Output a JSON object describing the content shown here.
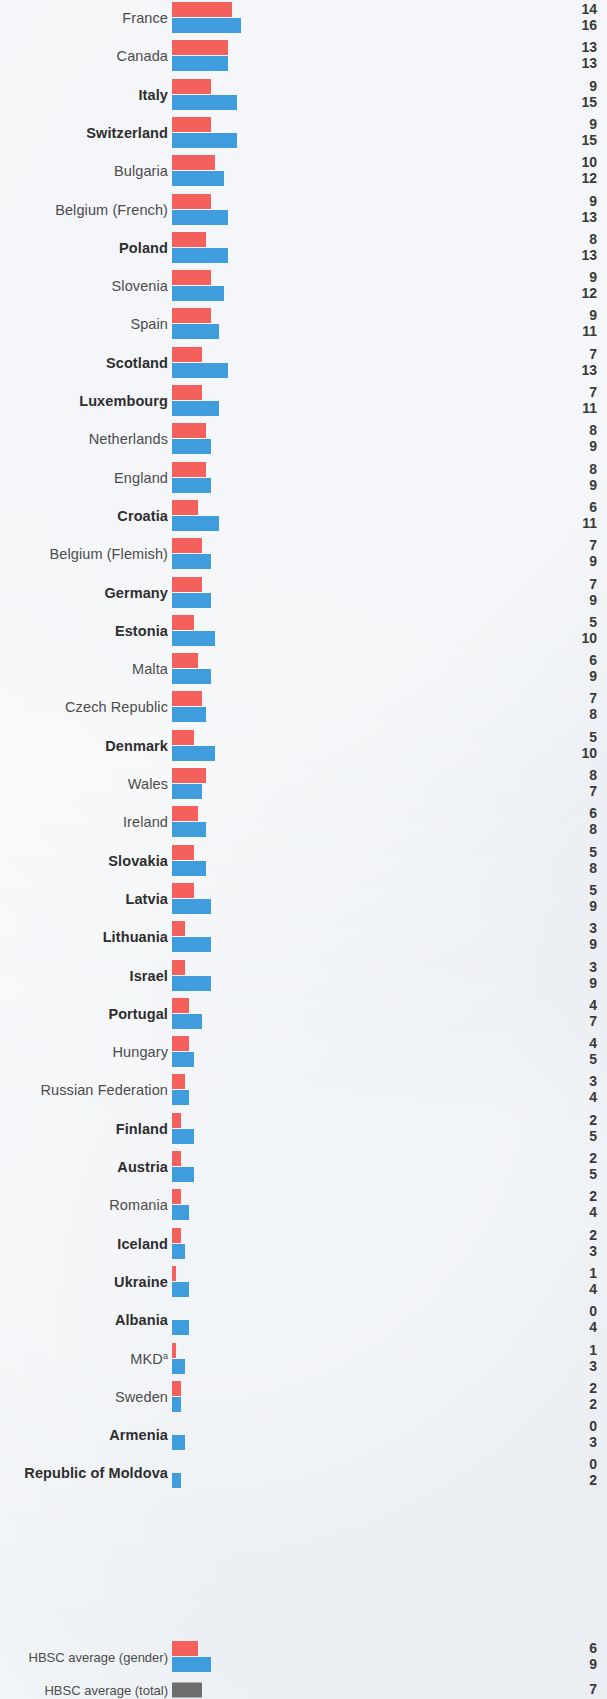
{
  "chart_data": {
    "type": "bar",
    "orientation": "horizontal",
    "title": "",
    "subtitle": "",
    "xlabel": "",
    "ylabel": "",
    "grid": false,
    "legend_position": "bottom-left",
    "xlim": [
      0,
      17
    ],
    "value_unit": "%",
    "categories": [
      "France",
      "Canada",
      "Italy",
      "Switzerland",
      "Bulgaria",
      "Belgium (French)",
      "Poland",
      "Slovenia",
      "Spain",
      "Scotland",
      "Luxembourg",
      "Netherlands",
      "England",
      "Croatia",
      "Belgium (Flemish)",
      "Germany",
      "Estonia",
      "Malta",
      "Czech Republic",
      "Denmark",
      "Wales",
      "Ireland",
      "Slovakia",
      "Latvia",
      "Lithuania",
      "Israel",
      "Portugal",
      "Hungary",
      "Russian Federation",
      "Finland",
      "Austria",
      "Romania",
      "Iceland",
      "Ukraine",
      "Albania",
      "MKD",
      "Sweden",
      "Armenia",
      "Republic of Moldova"
    ],
    "category_bold": [
      false,
      false,
      true,
      true,
      false,
      false,
      true,
      false,
      false,
      true,
      true,
      false,
      false,
      true,
      false,
      true,
      true,
      false,
      false,
      true,
      false,
      false,
      true,
      true,
      true,
      true,
      true,
      false,
      false,
      true,
      true,
      false,
      true,
      true,
      true,
      false,
      false,
      true,
      true
    ],
    "category_superscripts": {
      "MKD": "a"
    },
    "series": [
      {
        "name": "Boys",
        "color": "#f4615c",
        "values": [
          14,
          13,
          9,
          9,
          10,
          9,
          8,
          9,
          9,
          7,
          7,
          8,
          8,
          6,
          7,
          7,
          5,
          6,
          7,
          5,
          8,
          6,
          5,
          5,
          3,
          3,
          4,
          4,
          3,
          2,
          2,
          2,
          2,
          1,
          0,
          1,
          2,
          0,
          0
        ]
      },
      {
        "name": "Girls",
        "color": "#3f9ddd",
        "values": [
          16,
          13,
          15,
          15,
          12,
          13,
          13,
          12,
          11,
          13,
          11,
          9,
          9,
          11,
          9,
          9,
          10,
          9,
          8,
          10,
          7,
          8,
          8,
          9,
          9,
          9,
          7,
          5,
          4,
          5,
          5,
          4,
          3,
          4,
          4,
          3,
          2,
          3,
          2
        ]
      }
    ]
  },
  "legend": {
    "items": [
      {
        "label": "HBSC average (gender)",
        "type": "gender",
        "boys_value": 6,
        "girls_value": 9,
        "boys_color": "#f4615c",
        "girls_color": "#3f9ddd"
      },
      {
        "label": "HBSC average (total)",
        "type": "total",
        "value": 7,
        "color": "#6e6e6e"
      }
    ]
  },
  "colors": {
    "background": "#eef1f5",
    "boys": "#f4615c",
    "girls": "#3f9ddd",
    "total": "#6e6e6e",
    "label_text": "#4c4c4c",
    "value_text": "#3a3a3a"
  }
}
